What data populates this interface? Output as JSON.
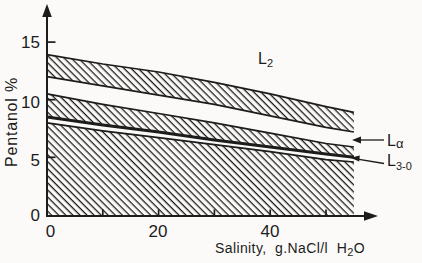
{
  "figure": {
    "background": "#fbfaf8",
    "ink": "#1c1c1c"
  },
  "chart_data": {
    "type": "area",
    "xlabel": {
      "pre": "Salinity,  g.NaCl/l  H",
      "sub": "2",
      "post": "O"
    },
    "ylabel": "Pentanol %",
    "xlim": [
      0,
      59
    ],
    "ylim": [
      0,
      17.8
    ],
    "x_band_end": 55,
    "grid": false,
    "xticks_major": [
      0,
      20,
      40
    ],
    "xtick_labels": [
      "0",
      "20",
      "40"
    ],
    "xticks_minor": [
      10,
      30,
      50
    ],
    "yticks": [
      0,
      5,
      10,
      15
    ],
    "ytick_labels": [
      "0",
      "5",
      "10",
      "15"
    ],
    "series": [
      {
        "name": "band1-top",
        "x": [
          0,
          10,
          20,
          30,
          40,
          50,
          55
        ],
        "y": [
          13.9,
          13.1,
          12.4,
          11.5,
          10.5,
          9.4,
          8.9
        ]
      },
      {
        "name": "band1-bottom",
        "x": [
          0,
          10,
          20,
          30,
          40,
          50,
          55
        ],
        "y": [
          12.0,
          11.2,
          10.4,
          9.6,
          8.6,
          7.6,
          7.2
        ]
      },
      {
        "name": "band2-top",
        "x": [
          0,
          10,
          20,
          30,
          40,
          50,
          55
        ],
        "y": [
          10.5,
          9.6,
          8.8,
          8.0,
          7.1,
          6.2,
          5.9
        ]
      },
      {
        "name": "band2-bottom",
        "x": [
          0,
          10,
          20,
          30,
          40,
          50,
          55
        ],
        "y": [
          8.5,
          7.8,
          7.2,
          6.5,
          5.9,
          5.3,
          5.0
        ]
      },
      {
        "name": "band3-top",
        "x": [
          0,
          10,
          20,
          30,
          40,
          50,
          55
        ],
        "y": [
          8.0,
          7.3,
          6.7,
          6.1,
          5.5,
          4.8,
          4.6
        ]
      }
    ],
    "bands": [
      {
        "name": "upper-hatched-band",
        "top": "band1-top",
        "bottom": "band1-bottom",
        "bottom_thick": false
      },
      {
        "name": "middle-hatched-band",
        "top": "band2-top",
        "bottom": "band2-bottom",
        "bottom_thick": true
      },
      {
        "name": "lower-hatched-band",
        "top": "band3-top",
        "bottom": "axis",
        "bottom_thick": false
      }
    ],
    "labels": {
      "l2": {
        "main": "L",
        "sub": "2"
      },
      "l_alpha": {
        "main": "L",
        "sub": "α"
      },
      "l3_0": {
        "main": "L",
        "sub": "3-0"
      }
    },
    "hatch": {
      "angle_deg": 45,
      "spacing_px": 5,
      "stroke_px": 1.3
    }
  }
}
